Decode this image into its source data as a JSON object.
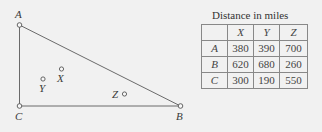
{
  "diagram": {
    "vertices": [
      {
        "id": "A",
        "label": "A"
      },
      {
        "id": "B",
        "label": "B"
      },
      {
        "id": "C",
        "label": "C"
      }
    ],
    "points": [
      {
        "id": "X",
        "label": "X"
      },
      {
        "id": "Y",
        "label": "Y"
      },
      {
        "id": "Z",
        "label": "Z"
      }
    ]
  },
  "table": {
    "title": "Distance in miles",
    "columns": [
      "",
      "X",
      "Y",
      "Z"
    ],
    "rows": [
      {
        "label": "A",
        "values": [
          "380",
          "390",
          "700"
        ]
      },
      {
        "label": "B",
        "values": [
          "620",
          "680",
          "260"
        ]
      },
      {
        "label": "C",
        "values": [
          "300",
          "190",
          "550"
        ]
      }
    ]
  },
  "colors": {
    "background": "#f1f1f1",
    "line": "#6a6a6a",
    "text": "#3a3a3a"
  }
}
